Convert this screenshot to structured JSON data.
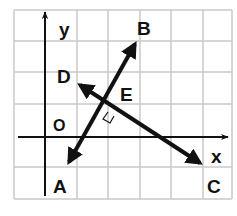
{
  "diagram": {
    "type": "coordinate-grid",
    "grid": {
      "columns": 7,
      "rows": 6,
      "line_color": "#c8c8c8",
      "background": "#ffffff"
    },
    "axes": {
      "x_label": "x",
      "y_label": "y",
      "origin_label": "O"
    },
    "points": {
      "A": "A",
      "B": "B",
      "C": "C",
      "D": "D",
      "E": "E"
    },
    "lines": [
      {
        "name": "AB",
        "from": "A",
        "to": "B",
        "arrows": "both"
      },
      {
        "name": "DC",
        "from": "D",
        "to": "C",
        "arrows": "both"
      }
    ],
    "annotation": "right angle at E (AB perpendicular to DC)",
    "ink_color": "#111111"
  }
}
